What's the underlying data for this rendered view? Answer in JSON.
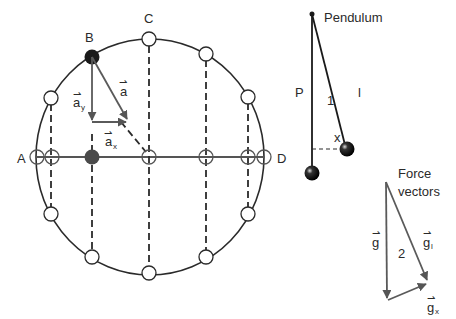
{
  "circle_diagram": {
    "labels": {
      "a": "A",
      "b": "B",
      "c": "C",
      "d": "D"
    },
    "vectors": {
      "a": "a",
      "a_y": "a",
      "a_y_sub": "y",
      "a_x": "a",
      "a_x_sub": "x",
      "arrow": "⇀"
    }
  },
  "pendulum": {
    "title": "Pendulum",
    "p_label": "P",
    "l_label": "l",
    "angle_label": "1",
    "x_label": "x"
  },
  "force_vectors": {
    "title_line1": "Force",
    "title_line2": "vectors",
    "g_label": "g",
    "gl_label": "g",
    "gl_sub": "l",
    "gx_label": "g",
    "gx_sub": "x",
    "angle_label": "2"
  },
  "colors": {
    "line": "#2a2a2a",
    "vector": "#5a5a5a",
    "filled_ball": "#1a1a1a",
    "shadow_ball": "#4a4a4a"
  }
}
